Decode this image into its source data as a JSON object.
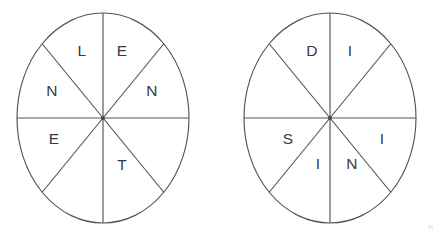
{
  "figure": {
    "background_color": "#ffffff",
    "stroke_color": "#545454",
    "text_color": "#3a3a3a",
    "canvas": {
      "width": 438,
      "height": 236
    }
  },
  "wheels": [
    {
      "id": "wheel-left",
      "name": "left-letter-wheel",
      "center": {
        "x": 103,
        "y": 118
      },
      "radius": {
        "x": 86,
        "y": 105
      },
      "sector_count": 8,
      "word": "LENNETTE",
      "letters_clockwise_from_top": [
        "E",
        "N",
        "",
        "T",
        "",
        "E",
        "N",
        "L"
      ],
      "sectors": [
        {
          "index": 0,
          "position": "top-right",
          "letter": "E",
          "label_offset": {
            "x": 19,
            "y": -66
          }
        },
        {
          "index": 1,
          "position": "right-upper",
          "letter": "N",
          "label_offset": {
            "x": 49,
            "y": -26
          }
        },
        {
          "index": 2,
          "position": "right-lower",
          "letter": "",
          "label_offset": {
            "x": 49,
            "y": 26
          }
        },
        {
          "index": 3,
          "position": "bottom-right",
          "letter": "T",
          "label_offset": {
            "x": 19,
            "y": 48
          }
        },
        {
          "index": 4,
          "position": "bottom-left",
          "letter": "",
          "label_offset": {
            "x": -19,
            "y": 48
          }
        },
        {
          "index": 5,
          "position": "left-lower",
          "letter": "E",
          "label_offset": {
            "x": -49,
            "y": 22
          }
        },
        {
          "index": 6,
          "position": "left-upper",
          "letter": "N",
          "label_offset": {
            "x": -51,
            "y": -26
          }
        },
        {
          "index": 7,
          "position": "top-left",
          "letter": "L",
          "label_offset": {
            "x": -21,
            "y": -66
          }
        }
      ]
    },
    {
      "id": "wheel-right",
      "name": "right-letter-wheel",
      "center": {
        "x": 330,
        "y": 118
      },
      "radius": {
        "x": 86,
        "y": 105
      },
      "sector_count": 8,
      "word": "DIISNIS",
      "letters_clockwise_from_top": [
        "I",
        "",
        "I",
        "N",
        "I",
        "S",
        "",
        "D"
      ],
      "sectors": [
        {
          "index": 0,
          "position": "top-right",
          "letter": "I",
          "label_offset": {
            "x": 20,
            "y": -66
          }
        },
        {
          "index": 1,
          "position": "right-upper",
          "letter": "",
          "label_offset": {
            "x": 50,
            "y": -26
          }
        },
        {
          "index": 2,
          "position": "right-lower",
          "letter": "I",
          "label_offset": {
            "x": 52,
            "y": 22
          }
        },
        {
          "index": 3,
          "position": "bottom-right",
          "letter": "N",
          "label_offset": {
            "x": 22,
            "y": 47
          }
        },
        {
          "index": 4,
          "position": "bottom-left",
          "letter": "I",
          "label_offset": {
            "x": -12,
            "y": 47
          }
        },
        {
          "index": 5,
          "position": "left-lower",
          "letter": "S",
          "label_offset": {
            "x": -42,
            "y": 22
          }
        },
        {
          "index": 6,
          "position": "left-upper",
          "letter": "",
          "label_offset": {
            "x": -50,
            "y": -26
          }
        },
        {
          "index": 7,
          "position": "top-left",
          "letter": "D",
          "label_offset": {
            "x": -18,
            "y": -66
          }
        }
      ]
    }
  ]
}
